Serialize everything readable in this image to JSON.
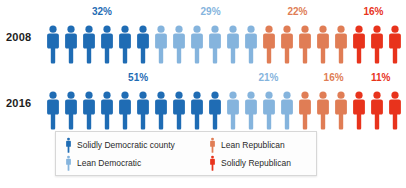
{
  "chart_data": {
    "type": "bar",
    "title": "",
    "subtitle": "",
    "xlabel": "",
    "ylabel": "",
    "unit_note": "Each icon represents 5% of counties",
    "categories": [
      "2008",
      "2016"
    ],
    "series": [
      {
        "name": "Solidly Democratic county",
        "color": "#1f6cb4",
        "values": [
          32,
          51
        ],
        "labels": [
          "32%",
          "51%"
        ],
        "icons": [
          6,
          10
        ]
      },
      {
        "name": "Lean Democratic",
        "color": "#85b4dd",
        "values": [
          29,
          21
        ],
        "labels": [
          "29%",
          "21%"
        ],
        "icons": [
          6,
          4
        ]
      },
      {
        "name": "Lean Republican",
        "color": "#e07d55",
        "values": [
          22,
          16
        ],
        "labels": [
          "22%",
          "16%"
        ],
        "icons": [
          5,
          3
        ]
      },
      {
        "name": "Solidly Republican",
        "color": "#e8331c",
        "values": [
          16,
          11
        ],
        "labels": [
          "16%",
          "11%"
        ],
        "icons": [
          3,
          3
        ]
      }
    ],
    "legend_position": "bottom-left",
    "grid": false
  },
  "rows": [
    {
      "year": "2008",
      "percent_labels": [
        {
          "text": "32%",
          "color": "#1f6cb4",
          "x_pct": 16
        },
        {
          "text": "29%",
          "color": "#85b4dd",
          "x_pct": 46
        },
        {
          "text": "22%",
          "color": "#e07d55",
          "x_pct": 70
        },
        {
          "text": "16%",
          "color": "#e8331c",
          "x_pct": 91
        }
      ],
      "segments": [
        {
          "name": "solidly-democratic",
          "color": "#1f6cb4",
          "count": 6
        },
        {
          "name": "lean-democratic",
          "color": "#85b4dd",
          "count": 6
        },
        {
          "name": "lean-republican",
          "color": "#e07d55",
          "count": 5
        },
        {
          "name": "solidly-republican",
          "color": "#e8331c",
          "count": 3
        }
      ]
    },
    {
      "year": "2016",
      "percent_labels": [
        {
          "text": "51%",
          "color": "#1f6cb4",
          "x_pct": 26
        },
        {
          "text": "21%",
          "color": "#85b4dd",
          "x_pct": 62
        },
        {
          "text": "16%",
          "color": "#e07d55",
          "x_pct": 80
        },
        {
          "text": "11%",
          "color": "#e8331c",
          "x_pct": 93
        }
      ],
      "segments": [
        {
          "name": "solidly-democratic",
          "color": "#1f6cb4",
          "count": 10
        },
        {
          "name": "lean-democratic",
          "color": "#85b4dd",
          "count": 4
        },
        {
          "name": "lean-republican",
          "color": "#e07d55",
          "count": 3
        },
        {
          "name": "solidly-republican",
          "color": "#e8331c",
          "count": 3
        }
      ]
    }
  ],
  "legend": {
    "items": [
      {
        "label": "Solidly Democratic county",
        "color": "#1f6cb4",
        "icon": "person-icon"
      },
      {
        "label": "Lean Republican",
        "color": "#e07d55",
        "icon": "person-icon"
      },
      {
        "label": "Lean Democratic",
        "color": "#85b4dd",
        "icon": "person-icon"
      },
      {
        "label": "Solidly Republican",
        "color": "#e8331c",
        "icon": "person-icon"
      }
    ]
  }
}
